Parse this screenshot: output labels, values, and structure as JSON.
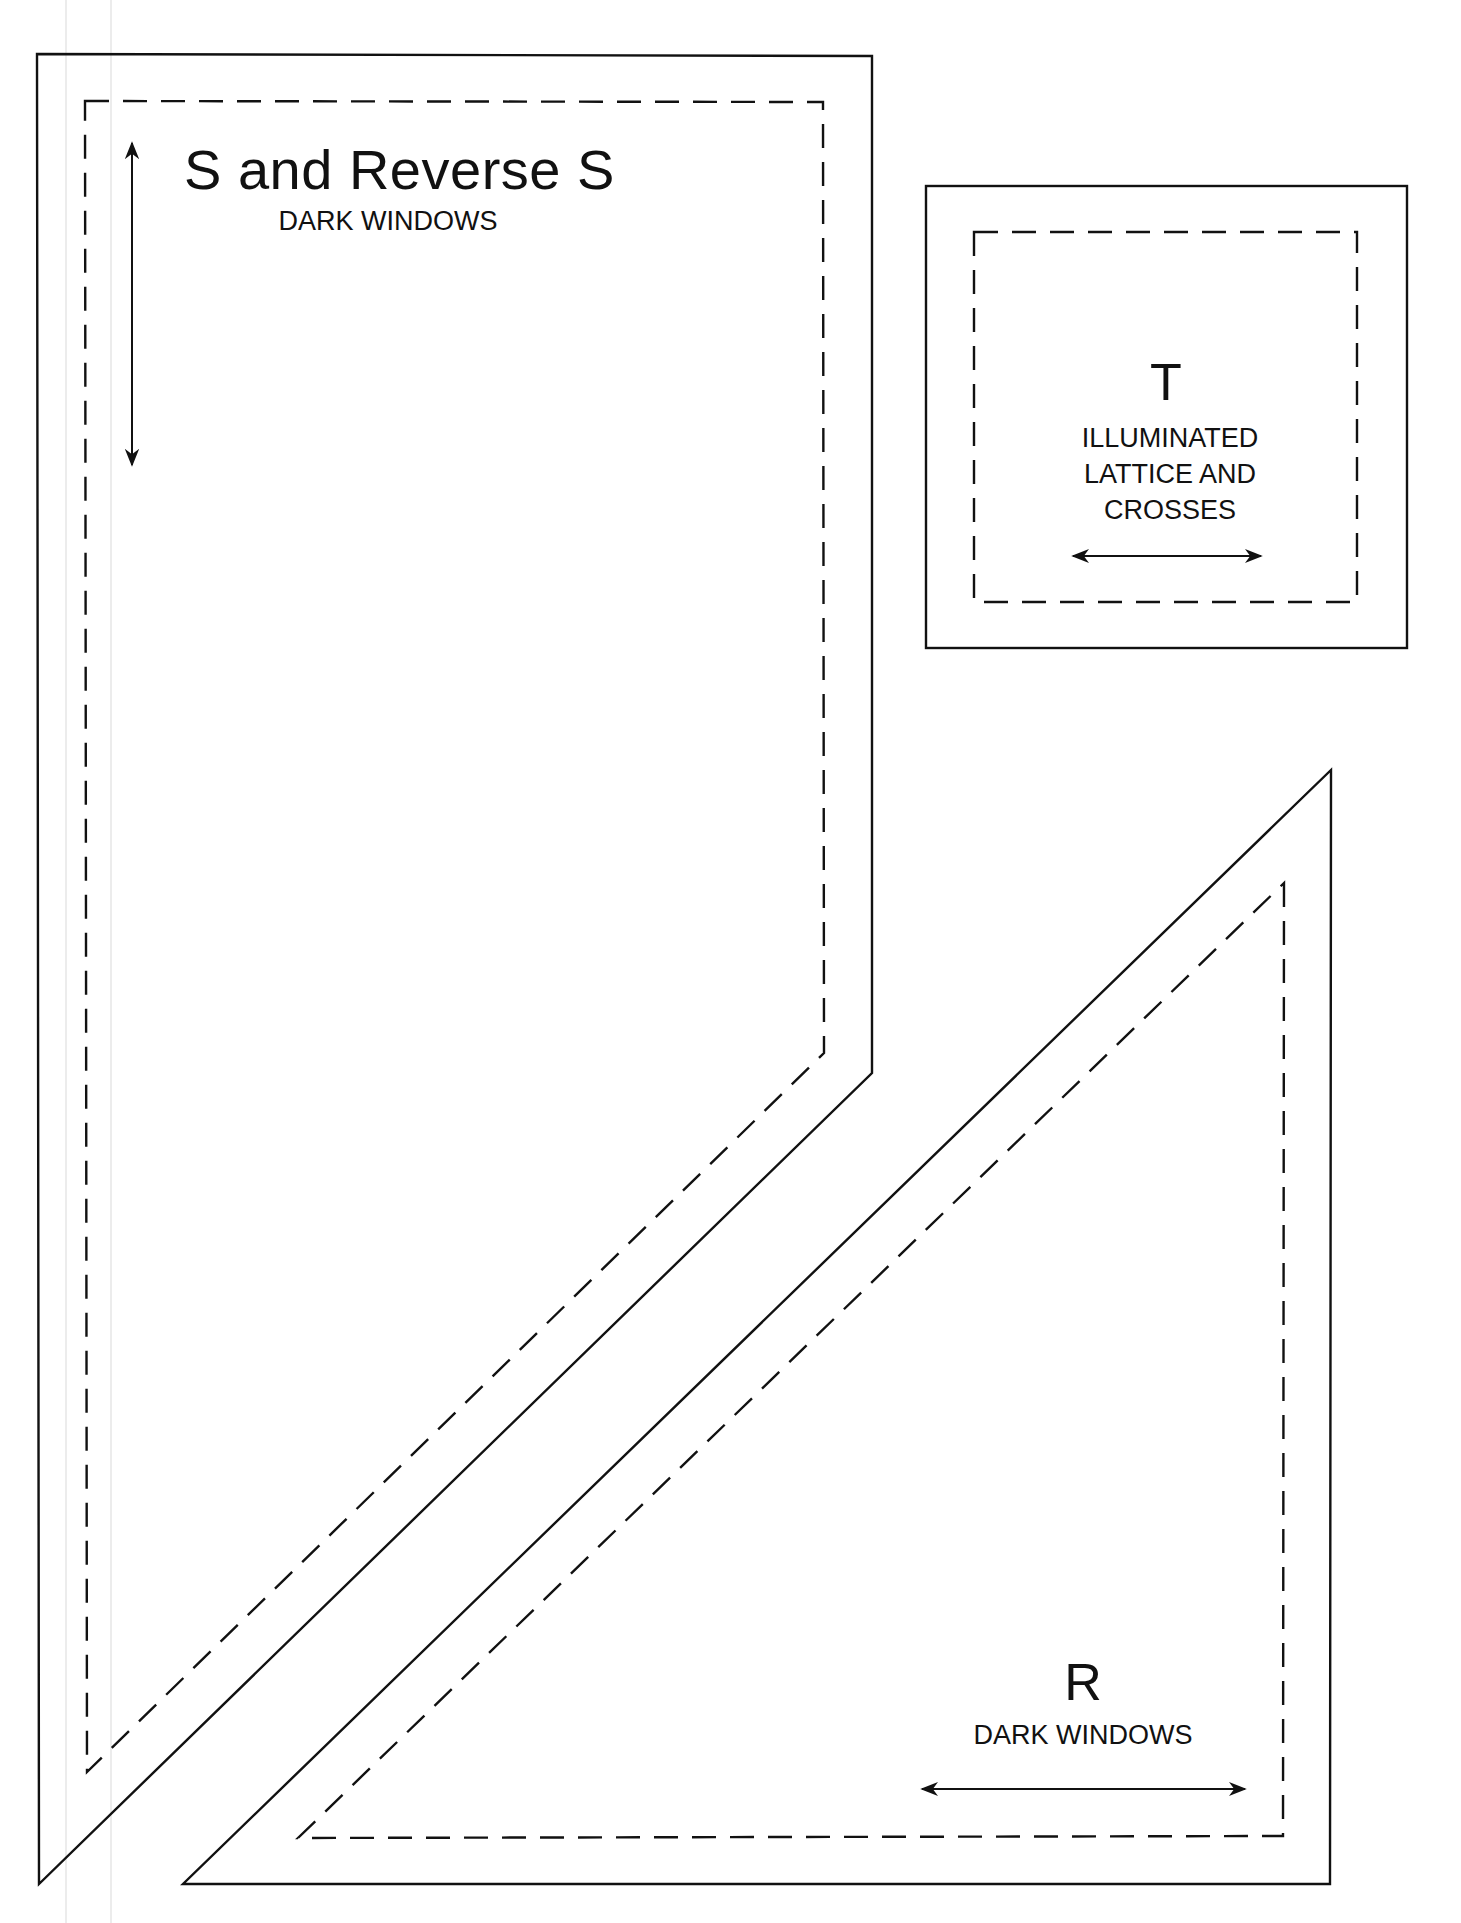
{
  "diagram": {
    "type": "quilt-template-sheet",
    "line_legend": {
      "solid": "cutting line",
      "dashed": "seam line",
      "double_arrow": "grain line"
    },
    "colors": {
      "ink": "#111111",
      "paper": "#ffffff"
    }
  },
  "pieces": [
    {
      "id": "S",
      "title": "S and Reverse S",
      "subtitle": "DARK WINDOWS",
      "shape": "pentagon (rectangle with angled bottom)",
      "grain_arrow": "vertical"
    },
    {
      "id": "T",
      "title": "T",
      "subtitle_lines": [
        "ILLUMINATED",
        "LATTICE AND",
        "CROSSES"
      ],
      "shape": "square",
      "grain_arrow": "horizontal"
    },
    {
      "id": "R",
      "title": "R",
      "subtitle": "DARK WINDOWS",
      "shape": "right triangle",
      "grain_arrow": "horizontal"
    }
  ]
}
